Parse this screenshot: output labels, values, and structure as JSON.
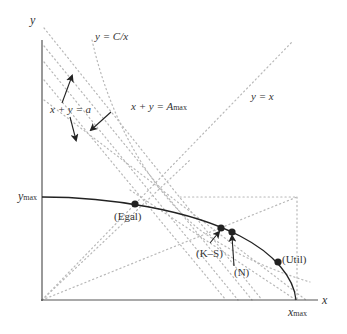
{
  "diagram": {
    "axes": {
      "x_label": "x",
      "y_label": "y",
      "x_max_label": "x",
      "x_max_sub": "max",
      "y_max_label": "y",
      "y_max_sub": "max"
    },
    "curves": {
      "hyperbola_label": "y = C/x",
      "diagonal_label": "y = x",
      "sum_family_label": "x + y = a",
      "sum_max_label": "x + y = A",
      "sum_max_sub": "max"
    },
    "points": [
      {
        "id": "egal",
        "label": "(Egal)"
      },
      {
        "id": "ks",
        "label": "(K–S)"
      },
      {
        "id": "n",
        "label": "(N)"
      },
      {
        "id": "util",
        "label": "(Util)"
      }
    ],
    "colors": {
      "axis": "#555555",
      "frontier": "#222222",
      "dotted": "#b8b8b8",
      "text": "#333333"
    }
  }
}
